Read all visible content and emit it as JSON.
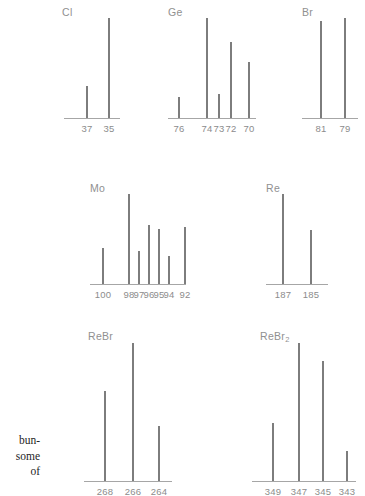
{
  "figure": {
    "style": {
      "peak_color": "#7d7d7d",
      "axis_color": "#a6a6a6",
      "label_color": "#909090",
      "tick_color": "#8c8c8c",
      "caption_color": "#252525",
      "background": "#ffffff"
    }
  },
  "caption_fragment": {
    "lines": [
      "bun-",
      "some",
      "of"
    ]
  },
  "chart_data": [
    {
      "type": "bar",
      "title": "Cl",
      "xlabel": "",
      "ylabel": "",
      "categories": [
        "37",
        "35"
      ],
      "values": [
        32,
        100
      ],
      "ylim": [
        0,
        100
      ],
      "grid": false,
      "legend": "none"
    },
    {
      "type": "bar",
      "title": "Ge",
      "xlabel": "",
      "ylabel": "",
      "categories": [
        "76",
        "74",
        "73",
        "72",
        "70"
      ],
      "values": [
        21,
        100,
        24,
        76,
        56
      ],
      "ylim": [
        0,
        100
      ],
      "grid": false,
      "legend": "none"
    },
    {
      "type": "bar",
      "title": "Br",
      "xlabel": "",
      "ylabel": "",
      "categories": [
        "81",
        "79"
      ],
      "values": [
        97,
        100
      ],
      "ylim": [
        0,
        100
      ],
      "grid": false,
      "legend": "none"
    },
    {
      "type": "bar",
      "title": "Mo",
      "xlabel": "",
      "ylabel": "",
      "categories": [
        "100",
        "98",
        "97",
        "96",
        "95",
        "94",
        "92"
      ],
      "values": [
        40,
        100,
        37,
        66,
        61,
        31,
        63
      ],
      "ylim": [
        0,
        100
      ],
      "grid": false,
      "legend": "none"
    },
    {
      "type": "bar",
      "title": "Re",
      "xlabel": "",
      "ylabel": "",
      "categories": [
        "187",
        "185"
      ],
      "values": [
        100,
        60
      ],
      "ylim": [
        0,
        100
      ],
      "grid": false,
      "legend": "none"
    },
    {
      "type": "bar",
      "title": "ReBr",
      "xlabel": "",
      "ylabel": "",
      "categories": [
        "268",
        "266",
        "264"
      ],
      "values": [
        65,
        100,
        40
      ],
      "ylim": [
        0,
        100
      ],
      "grid": false,
      "legend": "none"
    },
    {
      "type": "bar",
      "title": "ReBr2",
      "title_base": "ReBr",
      "title_sub": "2",
      "xlabel": "",
      "ylabel": "",
      "categories": [
        "349",
        "347",
        "345",
        "343"
      ],
      "values": [
        42,
        100,
        87,
        22
      ],
      "ylim": [
        0,
        100
      ],
      "grid": false,
      "legend": "none"
    }
  ],
  "panels": [
    {
      "label": "Cl",
      "left": 62,
      "top": 6,
      "axis_left": 2,
      "axis_width": 56,
      "axis_y": 112,
      "plot_h": 100,
      "peaks": [
        {
          "x": 24,
          "h": 32
        },
        {
          "x": 46,
          "h": 100
        }
      ],
      "ticks": [
        {
          "x": 24,
          "text": "37"
        },
        {
          "x": 46,
          "text": "35"
        }
      ]
    },
    {
      "label": "Ge",
      "left": 168,
      "top": 6,
      "axis_left": 0,
      "axis_width": 88,
      "axis_y": 112,
      "plot_h": 100,
      "peaks": [
        {
          "x": 10,
          "h": 21
        },
        {
          "x": 38,
          "h": 100
        },
        {
          "x": 50,
          "h": 24
        },
        {
          "x": 62,
          "h": 76
        },
        {
          "x": 80,
          "h": 56
        }
      ],
      "ticks": [
        {
          "x": 10,
          "text": "76"
        },
        {
          "x": 38,
          "text": "74"
        },
        {
          "x": 50,
          "text": "73"
        },
        {
          "x": 62,
          "text": "72"
        },
        {
          "x": 80,
          "text": "70"
        }
      ]
    },
    {
      "label": "Br",
      "left": 302,
      "top": 6,
      "axis_left": 0,
      "axis_width": 56,
      "axis_y": 112,
      "plot_h": 100,
      "peaks": [
        {
          "x": 18,
          "h": 97
        },
        {
          "x": 42,
          "h": 100
        }
      ],
      "ticks": [
        {
          "x": 18,
          "text": "81"
        },
        {
          "x": 42,
          "text": "79"
        }
      ]
    },
    {
      "label": "Mo",
      "left": 90,
      "top": 182,
      "axis_left": 0,
      "axis_width": 96,
      "axis_y": 102,
      "plot_h": 90,
      "peaks": [
        {
          "x": 12,
          "h": 40
        },
        {
          "x": 38,
          "h": 100
        },
        {
          "x": 48,
          "h": 37
        },
        {
          "x": 58,
          "h": 66
        },
        {
          "x": 68,
          "h": 61
        },
        {
          "x": 78,
          "h": 31
        },
        {
          "x": 94,
          "h": 63
        }
      ],
      "ticks": [
        {
          "x": 12,
          "text": "100"
        },
        {
          "x": 38,
          "text": "98"
        },
        {
          "x": 48,
          "text": "97"
        },
        {
          "x": 58,
          "text": "96"
        },
        {
          "x": 68,
          "text": "95"
        },
        {
          "x": 78,
          "text": "94"
        },
        {
          "x": 94,
          "text": "92"
        }
      ]
    },
    {
      "label": "Re",
      "left": 266,
      "top": 182,
      "axis_left": 0,
      "axis_width": 62,
      "axis_y": 102,
      "plot_h": 90,
      "peaks": [
        {
          "x": 16,
          "h": 100
        },
        {
          "x": 44,
          "h": 60
        }
      ],
      "ticks": [
        {
          "x": 16,
          "text": "187"
        },
        {
          "x": 44,
          "text": "185"
        }
      ]
    },
    {
      "label": "ReBr",
      "left": 88,
      "top": 330,
      "axis_left": -4,
      "axis_width": 88,
      "axis_y": 151,
      "plot_h": 138,
      "peaks": [
        {
          "x": 16,
          "h": 65
        },
        {
          "x": 44,
          "h": 100
        },
        {
          "x": 70,
          "h": 40
        }
      ],
      "ticks": [
        {
          "x": 16,
          "text": "268"
        },
        {
          "x": 44,
          "text": "266"
        },
        {
          "x": 70,
          "text": "264"
        }
      ]
    },
    {
      "label": "ReBr2",
      "left": 260,
      "top": 330,
      "axis_left": -8,
      "axis_width": 104,
      "axis_y": 151,
      "plot_h": 138,
      "peaks": [
        {
          "x": 12,
          "h": 42
        },
        {
          "x": 38,
          "h": 100
        },
        {
          "x": 62,
          "h": 87
        },
        {
          "x": 86,
          "h": 22
        }
      ],
      "ticks": [
        {
          "x": 12,
          "text": "349"
        },
        {
          "x": 38,
          "text": "347"
        },
        {
          "x": 62,
          "text": "345"
        },
        {
          "x": 86,
          "text": "343"
        }
      ]
    }
  ]
}
